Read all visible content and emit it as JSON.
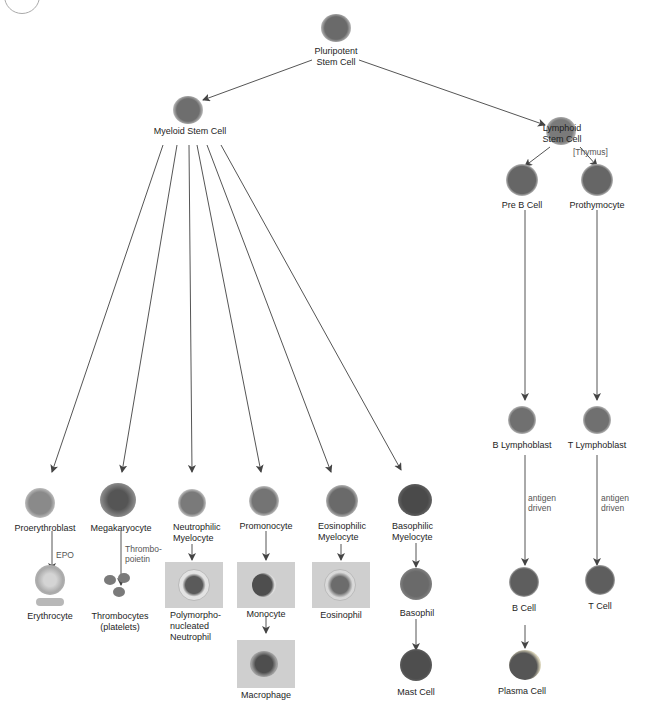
{
  "diagram": {
    "colors": {
      "line": "#555555",
      "text": "#1e1e1e",
      "panel": "#cfcfcf",
      "cell_nucleus": "#6e6e6e",
      "cell_cytoplasm": "#c8c8c8"
    },
    "nodes": {
      "pluripotent": {
        "label_lines": [
          "Pluripotent",
          "Stem Cell"
        ]
      },
      "myeloid": {
        "label": "Myeloid Stem Cell"
      },
      "lymphoid": {
        "label_lines": [
          "Lymphoid",
          "Stem Cell"
        ]
      },
      "proerythroblast": {
        "label": "Proerythroblast"
      },
      "erythrocyte": {
        "label": "Erythrocyte"
      },
      "megakaryocyte": {
        "label": "Megakaryocyte"
      },
      "thrombocytes": {
        "label_lines": [
          "Thrombocytes",
          "(platelets)"
        ]
      },
      "neutrophilic_myelocyte": {
        "label_lines": [
          "Neutrophilic",
          "Myelocyte"
        ]
      },
      "neutrophil": {
        "label_lines": [
          "Polymorpho-",
          "nucleated",
          "Neutrophil"
        ]
      },
      "promonocyte": {
        "label": "Promonocyte"
      },
      "monocyte": {
        "label": "Monocyte"
      },
      "macrophage": {
        "label": "Macrophage"
      },
      "eosinophilic_myelocyte": {
        "label_lines": [
          "Eosinophilic",
          "Myelocyte"
        ]
      },
      "eosinophil": {
        "label": "Eosinophil"
      },
      "basophilic_myelocyte": {
        "label_lines": [
          "Basophilic",
          "Myelocyte"
        ]
      },
      "basophil": {
        "label": "Basophil"
      },
      "mast_cell": {
        "label": "Mast Cell"
      },
      "pre_b_cell": {
        "label": "Pre B Cell"
      },
      "prothymocyte": {
        "label": "Prothymocyte"
      },
      "b_lymphoblast": {
        "label": "B Lymphoblast"
      },
      "t_lymphoblast": {
        "label": "T Lymphoblast"
      },
      "b_cell": {
        "label": "B Cell"
      },
      "t_cell": {
        "label": "T Cell"
      },
      "plasma_cell": {
        "label": "Plasma Cell"
      }
    },
    "edge_notes": {
      "epo": "EPO",
      "thrombopoietin_lines": [
        "Thrombo-",
        "poietin"
      ],
      "thymus": "[Thymus]",
      "antigen_b_lines": [
        "antigen",
        "driven"
      ],
      "antigen_t_lines": [
        "antigen",
        "driven"
      ]
    }
  }
}
